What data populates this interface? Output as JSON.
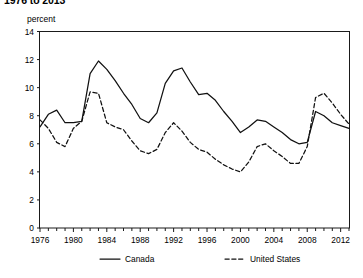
{
  "title": "1976 to 2013",
  "axis_unit_label": "percent",
  "legend": [
    {
      "label": "Canada",
      "style": "solid"
    },
    {
      "label": "United States",
      "style": "dashed"
    }
  ],
  "chart_data": {
    "type": "line",
    "title": "1976 to 2013",
    "xlabel": "",
    "ylabel": "percent",
    "ylim": [
      0,
      14
    ],
    "xlim": [
      1976,
      2013
    ],
    "grid": false,
    "legend_position": "bottom",
    "ytick_labels": [
      "0",
      "2",
      "4",
      "6",
      "8",
      "10",
      "12",
      "14"
    ],
    "ytick_values": [
      0,
      2,
      4,
      6,
      8,
      10,
      12,
      14
    ],
    "xtick_labels": [
      "1976",
      "1980",
      "1984",
      "1988",
      "1992",
      "1996",
      "2000",
      "2004",
      "2008",
      "2012"
    ],
    "xtick_values": [
      1976,
      1980,
      1984,
      1988,
      1992,
      1996,
      2000,
      2004,
      2008,
      2012
    ],
    "x": [
      1976,
      1977,
      1978,
      1979,
      1980,
      1981,
      1982,
      1983,
      1984,
      1985,
      1986,
      1987,
      1988,
      1989,
      1990,
      1991,
      1992,
      1993,
      1994,
      1995,
      1996,
      1997,
      1998,
      1999,
      2000,
      2001,
      2002,
      2003,
      2004,
      2005,
      2006,
      2007,
      2008,
      2009,
      2010,
      2011,
      2012,
      2013
    ],
    "series": [
      {
        "name": "Canada",
        "style": "solid",
        "values": [
          7.2,
          8.1,
          8.4,
          7.5,
          7.5,
          7.6,
          11.0,
          11.9,
          11.3,
          10.5,
          9.6,
          8.8,
          7.8,
          7.5,
          8.2,
          10.3,
          11.2,
          11.4,
          10.4,
          9.5,
          9.6,
          9.1,
          8.3,
          7.6,
          6.8,
          7.2,
          7.7,
          7.6,
          7.2,
          6.8,
          6.3,
          6.0,
          6.1,
          8.3,
          8.0,
          7.5,
          7.3,
          7.1
        ]
      },
      {
        "name": "United States",
        "style": "dashed",
        "values": [
          7.7,
          7.1,
          6.1,
          5.8,
          7.1,
          7.6,
          9.7,
          9.6,
          7.5,
          7.2,
          7.0,
          6.2,
          5.5,
          5.3,
          5.6,
          6.8,
          7.5,
          6.9,
          6.1,
          5.6,
          5.4,
          4.9,
          4.5,
          4.2,
          4.0,
          4.7,
          5.8,
          6.0,
          5.5,
          5.1,
          4.6,
          4.6,
          5.8,
          9.3,
          9.6,
          8.9,
          8.1,
          7.4
        ]
      }
    ]
  }
}
